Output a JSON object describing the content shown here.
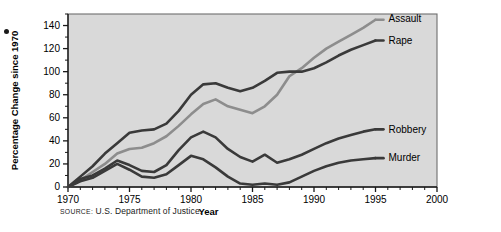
{
  "figure": {
    "bullet_icon": "bullet-dot",
    "source_prefix": "SOURCE",
    "source_separator": ":",
    "source_text": "U.S. Department of Justice."
  },
  "colors": {
    "plot_background": "#d9d9d9",
    "plot_border": "#6e6e6e",
    "axis": "#1a1a1a",
    "text": "#000000",
    "assault_line": "#8d8d8d",
    "rape_line": "#3a3a3a",
    "robbery_line": "#3a3a3a",
    "murder_line": "#3a3a3a",
    "page_background": "#ffffff"
  },
  "chart_data": {
    "type": "line",
    "title": "",
    "xlabel": "Year",
    "ylabel": "Percentage Change since 1970",
    "xlim": [
      1970,
      2000
    ],
    "ylim": [
      0,
      150
    ],
    "xticks": [
      1970,
      1975,
      1980,
      1985,
      1990,
      1995,
      2000
    ],
    "xtick_labels": [
      "1970",
      "1975",
      "1980",
      "1985",
      "1990",
      "1995",
      "2000"
    ],
    "x_minor_tick_step": 1,
    "yticks": [
      0,
      20,
      40,
      60,
      80,
      100,
      120,
      140
    ],
    "ytick_labels": [
      "0",
      "20",
      "40",
      "60",
      "80",
      "100",
      "120",
      "140"
    ],
    "y_minor_tick_step": 10,
    "grid": false,
    "legend_position": "right-inline-labels",
    "x": [
      1970,
      1971,
      1972,
      1973,
      1974,
      1975,
      1976,
      1977,
      1978,
      1979,
      1980,
      1981,
      1982,
      1983,
      1984,
      1985,
      1986,
      1987,
      1988,
      1989,
      1990,
      1991,
      1992,
      1993,
      1994,
      1995
    ],
    "series": [
      {
        "name": "Assault",
        "label": "Assault",
        "color": "#8d8d8d",
        "values": [
          0,
          6,
          13,
          20,
          29,
          33,
          34,
          38,
          44,
          53,
          63,
          72,
          76,
          70,
          67,
          64,
          70,
          80,
          96,
          103,
          112,
          120,
          126,
          132,
          138,
          145
        ]
      },
      {
        "name": "Rape",
        "label": "Rape",
        "color": "#3a3a3a",
        "values": [
          0,
          9,
          18,
          29,
          38,
          47,
          49,
          50,
          55,
          66,
          80,
          89,
          90,
          86,
          83,
          86,
          92,
          99,
          100,
          100,
          103,
          108,
          114,
          119,
          123,
          127
        ]
      },
      {
        "name": "Robbery",
        "label": "Robbery",
        "color": "#3a3a3a",
        "values": [
          0,
          7,
          10,
          16,
          23,
          19,
          14,
          13,
          19,
          32,
          43,
          48,
          43,
          33,
          26,
          22,
          28,
          21,
          24,
          28,
          33,
          38,
          42,
          45,
          48,
          50
        ]
      },
      {
        "name": "Murder",
        "label": "Murder",
        "color": "#3a3a3a",
        "values": [
          0,
          5,
          8,
          14,
          20,
          15,
          9,
          8,
          11,
          19,
          27,
          24,
          17,
          9,
          3,
          2,
          3,
          2,
          4,
          9,
          14,
          18,
          21,
          23,
          24,
          25
        ]
      }
    ]
  }
}
